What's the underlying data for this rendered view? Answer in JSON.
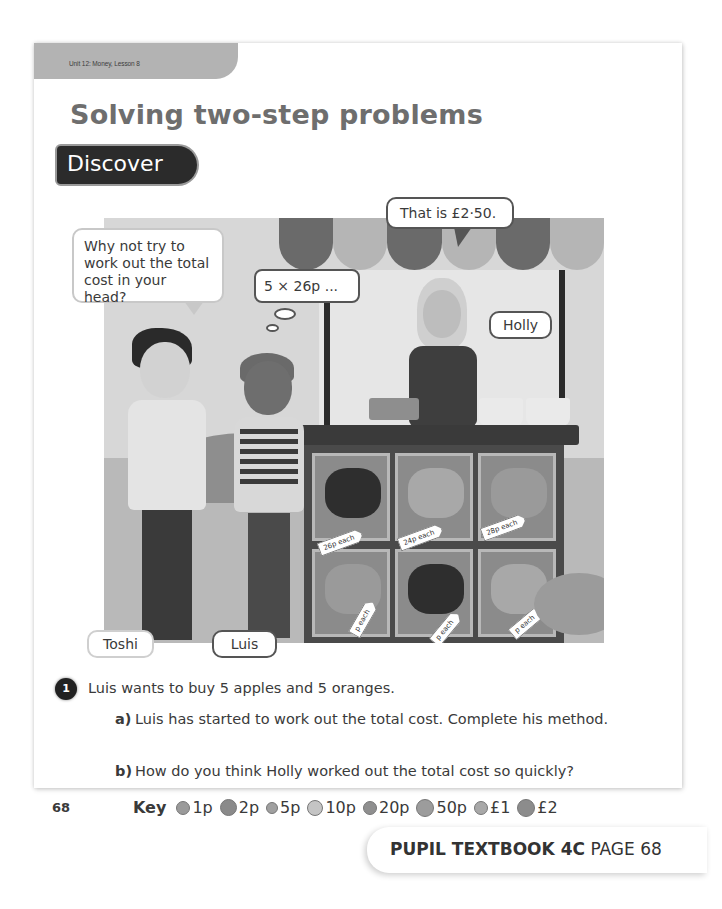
{
  "header": {
    "unit_label": "Unit 12: Money, Lesson 8",
    "title": "Solving two-step problems",
    "section_badge": "Discover"
  },
  "illustration": {
    "speech_bubbles": {
      "toshi": "Why not try to work out the total cost in your head?",
      "luis": "5 × 26p ...",
      "holly": "That is £2·50."
    },
    "name_labels": {
      "toshi": "Toshi",
      "luis": "Luis",
      "holly": "Holly"
    },
    "price_tags": [
      {
        "fruit": "plums",
        "label": "26p each"
      },
      {
        "fruit": "oranges",
        "label": "24p each"
      },
      {
        "fruit": "pears",
        "label": "28p each"
      },
      {
        "fruit": "bananas",
        "label": "p each"
      },
      {
        "fruit": "pineapples",
        "label": "p each"
      },
      {
        "fruit": "apples",
        "label": "p each"
      }
    ]
  },
  "questions": {
    "number": "1",
    "intro": "Luis wants to buy 5 apples and 5 oranges.",
    "parts": [
      {
        "letter": "a)",
        "text": "Luis has started to work out the total cost. Complete his method."
      },
      {
        "letter": "b)",
        "text": "How do you think Holly worked out the total cost so quickly?"
      }
    ]
  },
  "footer": {
    "page_number": "68",
    "key_label": "Key",
    "coins": [
      {
        "label": "1p",
        "icon": "coin-1p-icon",
        "color": "#9a9a9a",
        "size": 14
      },
      {
        "label": "2p",
        "icon": "coin-2p-icon",
        "color": "#8a8a8a",
        "size": 17
      },
      {
        "label": "5p",
        "icon": "coin-5p-icon",
        "color": "#a0a0a0",
        "size": 12
      },
      {
        "label": "10p",
        "icon": "coin-10p-icon",
        "color": "#c4c4c4",
        "size": 16
      },
      {
        "label": "20p",
        "icon": "coin-20p-icon",
        "color": "#8f8f8f",
        "size": 14
      },
      {
        "label": "50p",
        "icon": "coin-50p-icon",
        "color": "#9c9c9c",
        "size": 18
      },
      {
        "label": "£1",
        "icon": "coin-1pound-icon",
        "color": "#a8a8a8",
        "size": 14
      },
      {
        "label": "£2",
        "icon": "coin-2pound-icon",
        "color": "#8c8c8c",
        "size": 18
      }
    ],
    "book_title": "PUPIL TEXTBOOK 4C",
    "book_page": "PAGE 68"
  }
}
